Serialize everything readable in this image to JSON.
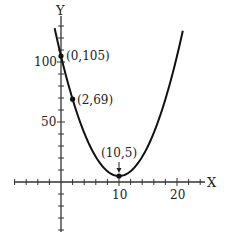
{
  "chart_data": {
    "type": "line",
    "title": "",
    "xlabel": "X",
    "ylabel": "Y",
    "function": "y = (x - 10)^2 + 5",
    "xlim": [
      -8,
      25
    ],
    "ylim": [
      -40,
      140
    ],
    "x_ticks": [
      10,
      20
    ],
    "x_tick_labels": [
      "10",
      "20"
    ],
    "y_ticks": [
      50,
      100
    ],
    "y_tick_labels": [
      "50",
      "100"
    ],
    "x_minor_step": 2,
    "y_minor_step": 10,
    "grid": false,
    "series": [
      {
        "name": "parabola",
        "x": [
          -1,
          0,
          2,
          4,
          6,
          8,
          10,
          12,
          14,
          16,
          18,
          20,
          21
        ],
        "values": [
          126,
          105,
          69,
          41,
          21,
          9,
          5,
          9,
          21,
          41,
          69,
          105,
          126
        ]
      }
    ],
    "points": [
      {
        "x": 0,
        "y": 105,
        "label": "(0,105)"
      },
      {
        "x": 2,
        "y": 69,
        "label": "(2,69)"
      },
      {
        "x": 10,
        "y": 5,
        "label": "(10,5)"
      }
    ],
    "annotations": [
      "(0,105)",
      "(2,69)",
      "(10,5)"
    ]
  },
  "axes": {
    "x_label": "X",
    "y_label": "Y",
    "tick_10": "10",
    "tick_20": "20",
    "tick_50": "50",
    "tick_100": "100"
  },
  "labels": {
    "p0": "(0,105)",
    "p1": "(2,69)",
    "p2": "(10,5)"
  }
}
